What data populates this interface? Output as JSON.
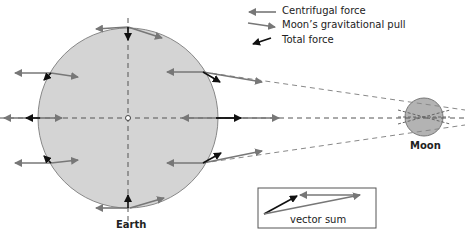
{
  "legend": {
    "centrifugal": "Centrifugal force",
    "gravitational": "Moon’s gravitational pull",
    "total": "Total force"
  },
  "labels": {
    "earth": "Earth",
    "moon": "Moon",
    "vector_sum": "vector sum"
  },
  "colors": {
    "earth_fill": "#d4d4d4",
    "moon_fill": "#b3b3b3",
    "centrifugal_arrow": "#777777",
    "gravity_arrow": "#777777",
    "total_arrow": "#111111"
  }
}
